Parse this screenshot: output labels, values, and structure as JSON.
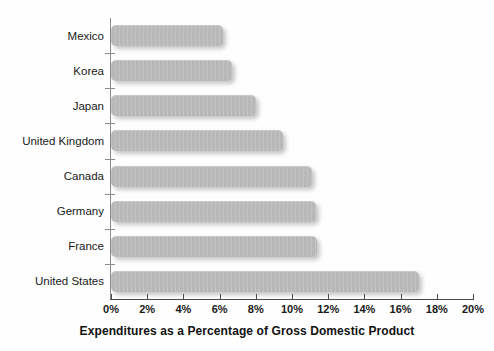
{
  "chart_data": {
    "type": "bar",
    "orientation": "horizontal",
    "title": "",
    "xlabel": "Expenditures as a Percentage of Gross Domestic Product",
    "ylabel": "",
    "xlim": [
      0,
      20
    ],
    "grid": false,
    "legend": null,
    "categories": [
      "Mexico",
      "Korea",
      "Japan",
      "United Kingdom",
      "Canada",
      "Germany",
      "France",
      "United States"
    ],
    "values": [
      6.2,
      6.7,
      8.0,
      9.5,
      11.1,
      11.3,
      11.4,
      17.0
    ],
    "xtick_labels": [
      "0%",
      "2%",
      "4%",
      "6%",
      "8%",
      "10%",
      "12%",
      "14%",
      "16%",
      "18%",
      "20%"
    ],
    "xtick_values": [
      0,
      2,
      4,
      6,
      8,
      10,
      12,
      14,
      16,
      18,
      20
    ],
    "colors": {
      "bar_fill": "#b8b8b8",
      "axis": "#4a4a4a",
      "text": "#1a1a1a",
      "background": "#ffffff"
    }
  }
}
